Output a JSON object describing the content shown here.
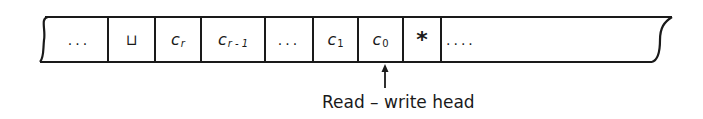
{
  "diagram": {
    "type": "turing-machine-tape",
    "cells": [
      {
        "content": "...",
        "kind": "ellipsis"
      },
      {
        "content": "⊔",
        "kind": "blank-symbol"
      },
      {
        "content": "c",
        "subscript": "r",
        "kind": "symbol"
      },
      {
        "content": "c",
        "subscript": "r - 1",
        "kind": "symbol"
      },
      {
        "content": "...",
        "kind": "ellipsis"
      },
      {
        "content": "c",
        "subscript": "1",
        "kind": "symbol"
      },
      {
        "content": "c",
        "subscript": "0",
        "kind": "symbol"
      },
      {
        "content": "*",
        "kind": "marker"
      },
      {
        "content": "....",
        "kind": "ellipsis"
      }
    ],
    "head": {
      "label": "Read – write head",
      "points_to_cell_index": 6
    },
    "colors": {
      "stroke": "#1a1a1a",
      "background": "#ffffff"
    }
  }
}
